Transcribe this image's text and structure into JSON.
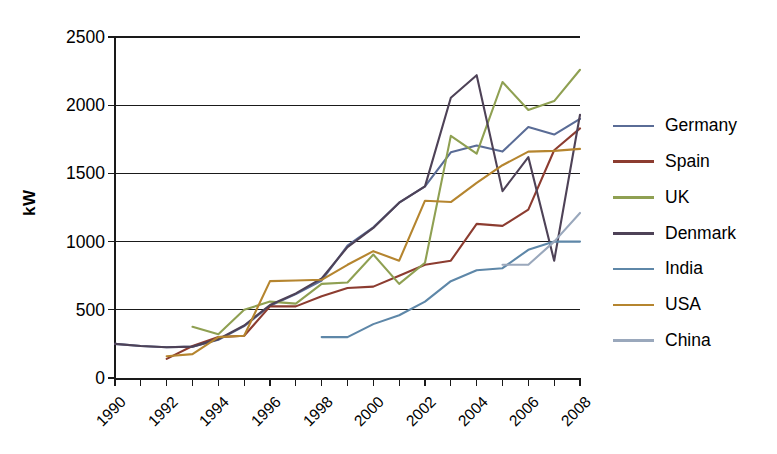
{
  "chart_data": {
    "type": "line",
    "title": "",
    "xlabel": "",
    "ylabel": "kW",
    "xlim": [
      1990,
      2008
    ],
    "ylim": [
      0,
      2500
    ],
    "ytick_values": [
      0,
      500,
      1000,
      1500,
      2000,
      2500
    ],
    "ytick_labels": [
      "0",
      "500",
      "1000",
      "1500",
      "2000",
      "2500"
    ],
    "xtick_values": [
      1990,
      1991,
      1992,
      1993,
      1994,
      1995,
      1996,
      1997,
      1998,
      1999,
      2000,
      2001,
      2002,
      2003,
      2004,
      2005,
      2006,
      2007,
      2008
    ],
    "xtick_labels": [
      "1990",
      "",
      "1992",
      "",
      "1994",
      "",
      "1996",
      "",
      "1998",
      "",
      "2000",
      "",
      "2002",
      "",
      "2004",
      "",
      "2006",
      "",
      "2008"
    ],
    "grid": "horizontal",
    "legend_position": "right",
    "x": [
      1990,
      1991,
      1992,
      1993,
      1994,
      1995,
      1996,
      1997,
      1998,
      1999,
      2000,
      2001,
      2002,
      2003,
      2004,
      2005,
      2006,
      2007,
      2008
    ],
    "series": [
      {
        "name": "Germany",
        "color": "#5a6c96",
        "x": [
          1990,
          1991,
          1992,
          1993,
          1994,
          1995,
          1996,
          1997,
          1998,
          1999,
          2000,
          2001,
          2002,
          2003,
          2004,
          2005,
          2006,
          2007,
          2008
        ],
        "values": [
          250,
          235,
          225,
          230,
          280,
          380,
          530,
          615,
          715,
          970,
          1105,
          1285,
          1405,
          1655,
          1705,
          1660,
          1840,
          1785,
          1900
        ]
      },
      {
        "name": "Spain",
        "color": "#8c3c30",
        "x": [
          1992,
          1993,
          1994,
          1995,
          1996,
          1997,
          1998,
          1999,
          2000,
          2001,
          2002,
          2003,
          2004,
          2005,
          2006,
          2007,
          2008
        ],
        "values": [
          140,
          235,
          300,
          310,
          525,
          525,
          600,
          660,
          670,
          750,
          830,
          860,
          1130,
          1115,
          1235,
          1670,
          1830
        ]
      },
      {
        "name": "UK",
        "color": "#8fa052",
        "x": [
          1993,
          1994,
          1995,
          1996,
          1997,
          1998,
          1999,
          2000,
          2001,
          2002,
          2003,
          2004,
          2005,
          2006,
          2007,
          2008
        ],
        "values": [
          375,
          320,
          500,
          560,
          545,
          690,
          700,
          905,
          690,
          845,
          1775,
          1645,
          2170,
          1965,
          2030,
          2260
        ]
      },
      {
        "name": "Denmark",
        "color": "#4e4257",
        "x": [
          1990,
          1991,
          1992,
          1993,
          1994,
          1995,
          1996,
          1997,
          1998,
          1999,
          2000,
          2001,
          2002,
          2003,
          2004,
          2005,
          2006,
          2007,
          2008
        ],
        "values": [
          250,
          235,
          225,
          230,
          285,
          385,
          535,
          620,
          730,
          960,
          1100,
          1285,
          1405,
          2055,
          2220,
          1370,
          1620,
          860,
          1930
        ]
      },
      {
        "name": "India",
        "color": "#5e87a8",
        "x": [
          1998,
          1999,
          2000,
          2001,
          2002,
          2003,
          2004,
          2005,
          2006,
          2007,
          2008
        ],
        "values": [
          300,
          300,
          395,
          460,
          560,
          710,
          790,
          805,
          940,
          1000,
          1000
        ]
      },
      {
        "name": "USA",
        "color": "#b5852f",
        "x": [
          1992,
          1993,
          1994,
          1995,
          1996,
          1997,
          1998,
          1999,
          2000,
          2001,
          2002,
          2003,
          2004,
          2005,
          2006,
          2007,
          2008
        ],
        "values": [
          160,
          175,
          300,
          310,
          710,
          715,
          720,
          830,
          930,
          860,
          1300,
          1290,
          1430,
          1560,
          1660,
          1665,
          1680
        ]
      },
      {
        "name": "China",
        "color": "#9aa8bc",
        "x": [
          2005,
          2006,
          2007,
          2008
        ],
        "values": [
          830,
          830,
          1000,
          1210
        ]
      }
    ]
  },
  "legend": {
    "items": [
      {
        "label": "Germany"
      },
      {
        "label": "Spain"
      },
      {
        "label": "UK"
      },
      {
        "label": "Denmark"
      },
      {
        "label": "India"
      },
      {
        "label": "USA"
      },
      {
        "label": "China"
      }
    ]
  }
}
